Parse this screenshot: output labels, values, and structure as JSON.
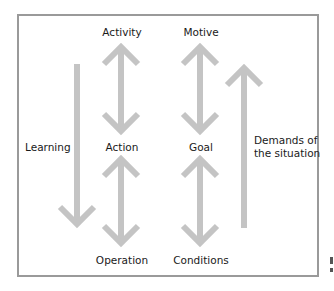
{
  "diagram": {
    "type": "activity-theory-hierarchy",
    "arrow_color": "#c4c4c4",
    "frame_color": "#9a9a9a",
    "levels": [
      {
        "left": "Activity",
        "right": "Motive"
      },
      {
        "left": "Action",
        "right": "Goal"
      },
      {
        "left": "Operation",
        "right": "Conditions"
      }
    ],
    "side_labels": {
      "left": "Learning",
      "right_line1": "Demands of",
      "right_line2": "the situation"
    },
    "arrows": [
      {
        "id": "learning",
        "direction": "down"
      },
      {
        "id": "activity-action",
        "direction": "both"
      },
      {
        "id": "motive-goal",
        "direction": "both"
      },
      {
        "id": "action-operation",
        "direction": "both"
      },
      {
        "id": "goal-conditions",
        "direction": "both"
      },
      {
        "id": "demands",
        "direction": "up"
      }
    ]
  }
}
